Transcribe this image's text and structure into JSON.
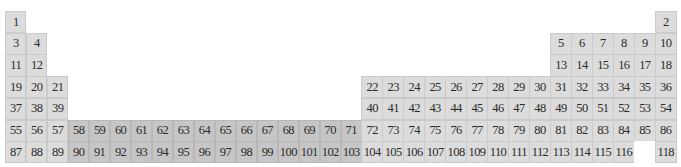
{
  "colors": {
    "main_block": "#dcdcdc",
    "f_block": "#c6c6c6",
    "empty": "#ffffff"
  },
  "rows": [
    {
      "period": 1,
      "cells": [
        {
          "n": "1",
          "col": 1
        },
        {
          "n": "2",
          "col": 32
        }
      ]
    },
    {
      "period": 2,
      "cells": [
        {
          "n": "3",
          "col": 1
        },
        {
          "n": "4",
          "col": 2
        },
        {
          "n": "5",
          "col": 27
        },
        {
          "n": "6",
          "col": 28
        },
        {
          "n": "7",
          "col": 29
        },
        {
          "n": "8",
          "col": 30
        },
        {
          "n": "9",
          "col": 31
        },
        {
          "n": "10",
          "col": 32
        }
      ]
    },
    {
      "period": 3,
      "cells": [
        {
          "n": "11",
          "col": 1
        },
        {
          "n": "12",
          "col": 2
        },
        {
          "n": "13",
          "col": 27
        },
        {
          "n": "14",
          "col": 28
        },
        {
          "n": "15",
          "col": 29
        },
        {
          "n": "16",
          "col": 30
        },
        {
          "n": "17",
          "col": 31
        },
        {
          "n": "18",
          "col": 32
        }
      ]
    },
    {
      "period": 4,
      "start_col": 1,
      "skip_after": 3,
      "resume_col": 18,
      "numbers": [
        "19",
        "20",
        "21",
        "22",
        "23",
        "24",
        "25",
        "26",
        "27",
        "28",
        "29",
        "30",
        "31",
        "32",
        "33",
        "34",
        "35",
        "36"
      ]
    },
    {
      "period": 5,
      "start_col": 1,
      "skip_after": 3,
      "resume_col": 18,
      "numbers": [
        "37",
        "38",
        "39",
        "40",
        "41",
        "42",
        "43",
        "44",
        "45",
        "46",
        "47",
        "48",
        "49",
        "50",
        "51",
        "52",
        "53",
        "54"
      ]
    },
    {
      "period": 6,
      "full": true,
      "numbers": [
        "55",
        "56",
        "57",
        "58",
        "59",
        "60",
        "61",
        "62",
        "63",
        "64",
        "65",
        "66",
        "67",
        "68",
        "69",
        "70",
        "71",
        "72",
        "73",
        "74",
        "75",
        "76",
        "77",
        "78",
        "79",
        "80",
        "81",
        "82",
        "83",
        "84",
        "85",
        "86"
      ]
    },
    {
      "period": 7,
      "full": true,
      "numbers": [
        "87",
        "88",
        "89",
        "90",
        "91",
        "92",
        "93",
        "94",
        "95",
        "96",
        "97",
        "98",
        "99",
        "100",
        "101",
        "102",
        "103",
        "104",
        "105",
        "106",
        "107",
        "108",
        "109",
        "110",
        "111",
        "112",
        "113",
        "114",
        "115",
        "116",
        "",
        "118"
      ]
    }
  ],
  "f_block_columns": [
    4,
    5,
    6,
    7,
    8,
    9,
    10,
    11,
    12,
    13,
    14,
    15,
    16,
    17
  ],
  "missing_elements": [
    "117"
  ]
}
